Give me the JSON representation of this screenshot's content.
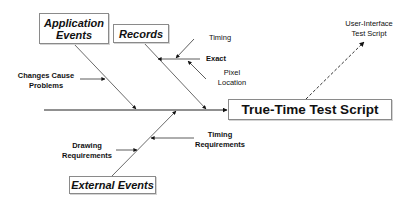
{
  "diagram": {
    "type": "fishbone",
    "effect": "True-Time Test Script",
    "output": "User-Interface Test Script",
    "categories": [
      {
        "label_line1": "Application",
        "label_line2": "Events",
        "causes": [
          "Changes Cause Problems"
        ]
      },
      {
        "label": "Records",
        "causes": [
          "Timing",
          "Exact",
          "Pixel Location"
        ]
      },
      {
        "label": "External Events",
        "causes": [
          "Drawing Requirements",
          "Timing Requirements"
        ]
      }
    ]
  },
  "labels": {
    "app_events_1": "Application",
    "app_events_2": "Events",
    "records": "Records",
    "external_events": "External Events",
    "effect": "True-Time Test Script",
    "output_1": "User-Interface",
    "output_2": "Test Script",
    "changes_1": "Changes Cause",
    "changes_2": "Problems",
    "timing": "Timing",
    "exact": "Exact",
    "pixel_1": "Pixel",
    "pixel_2": "Location",
    "drawing_1": "Drawing",
    "drawing_2": "Requirements",
    "timing_req_1": "Timing",
    "timing_req_2": "Requirements"
  }
}
